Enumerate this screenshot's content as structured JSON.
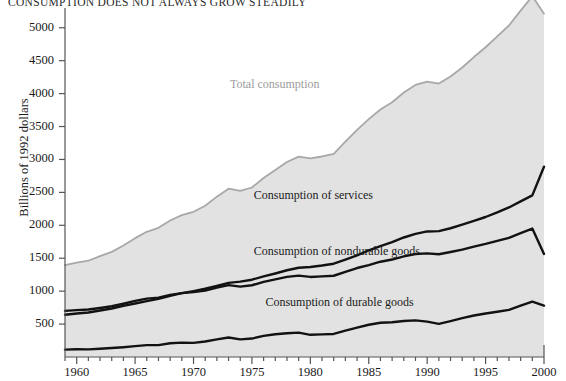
{
  "title": "CONSUMPTION DOES NOT ALWAYS GROW STEADILY",
  "axes": {
    "ylabel": "Billions of 1992 dollars",
    "yticks": [
      "500",
      "1000",
      "1500",
      "2000",
      "2500",
      "3000",
      "3500",
      "4000",
      "4500",
      "5000"
    ],
    "xticks": [
      "1960",
      "1965",
      "1970",
      "1975",
      "1980",
      "1985",
      "1990",
      "1995",
      "2000"
    ]
  },
  "colors": {
    "area_fill": "#e2e2e2",
    "total_line": "#a8a8a8",
    "component_line": "#121212",
    "axis": "#555555",
    "text": "#1a1a1a",
    "total_label": "#9b9b9b"
  },
  "chart_data": {
    "type": "line",
    "title": "CONSUMPTION DOES NOT ALWAYS GROW STEADILY",
    "xlabel": "",
    "ylabel": "Billions of 1992 dollars",
    "xlim": [
      1959,
      2000
    ],
    "ylim": [
      0,
      5300
    ],
    "yticks": [
      500,
      1000,
      1500,
      2000,
      2500,
      3000,
      3500,
      4000,
      4500,
      5000
    ],
    "xticks": [
      1960,
      1965,
      1970,
      1975,
      1980,
      1985,
      1990,
      1995,
      2000
    ],
    "xminor_step": 1,
    "grid": false,
    "legend": "inline-annotations",
    "x": [
      1959,
      1960,
      1961,
      1962,
      1963,
      1964,
      1965,
      1966,
      1967,
      1968,
      1969,
      1970,
      1971,
      1972,
      1973,
      1974,
      1975,
      1976,
      1977,
      1978,
      1979,
      1980,
      1981,
      1982,
      1983,
      1984,
      1985,
      1986,
      1987,
      1988,
      1989,
      1990,
      1991,
      1992,
      1993,
      1994,
      1995,
      1996,
      1997,
      1998,
      1999,
      2000
    ],
    "series": [
      {
        "name": "Total consumption",
        "color": "#a8a8a8",
        "filled": true,
        "values": [
          1394,
          1432,
          1462,
          1532,
          1597,
          1693,
          1805,
          1901,
          1962,
          2073,
          2154,
          2205,
          2298,
          2435,
          2556,
          2523,
          2574,
          2719,
          2840,
          2962,
          3042,
          3018,
          3045,
          3085,
          3271,
          3449,
          3613,
          3759,
          3869,
          4017,
          4131,
          4183,
          4152,
          4259,
          4396,
          4555,
          4704,
          4870,
          5034,
          5260,
          5480,
          5214
        ]
      },
      {
        "name": "Consumption of services",
        "color": "#121212",
        "filled": false,
        "values": [
          642,
          660,
          676,
          706,
          736,
          776,
          812,
          849,
          883,
          928,
          969,
          1001,
          1036,
          1080,
          1126,
          1144,
          1174,
          1223,
          1268,
          1317,
          1356,
          1367,
          1389,
          1417,
          1480,
          1543,
          1619,
          1684,
          1744,
          1815,
          1870,
          1907,
          1911,
          1955,
          2009,
          2066,
          2126,
          2196,
          2271,
          2363,
          2454,
          2890
        ]
      },
      {
        "name": "Consumption of nondurable goods",
        "color": "#121212",
        "filled": false,
        "values": [
          700,
          712,
          722,
          745,
          770,
          809,
          852,
          887,
          902,
          944,
          970,
          985,
          1010,
          1056,
          1092,
          1068,
          1090,
          1140,
          1180,
          1217,
          1236,
          1216,
          1224,
          1234,
          1294,
          1351,
          1395,
          1447,
          1480,
          1527,
          1564,
          1573,
          1560,
          1594,
          1630,
          1677,
          1717,
          1764,
          1810,
          1882,
          1951,
          1566
        ]
      },
      {
        "name": "Consumption of durable goods",
        "color": "#121212",
        "filled": false,
        "values": [
          112,
          118,
          116,
          126,
          136,
          149,
          165,
          180,
          180,
          208,
          219,
          214,
          235,
          268,
          296,
          268,
          280,
          320,
          345,
          360,
          370,
          337,
          344,
          350,
          400,
          447,
          490,
          520,
          527,
          546,
          556,
          537,
          503,
          545,
          590,
          630,
          661,
          688,
          716,
          780,
          840,
          780
        ]
      }
    ],
    "annotations": [
      {
        "text": "Total consumption",
        "x": 1981,
        "y": 4130
      },
      {
        "text": "Consumption of services",
        "x": 1982,
        "y": 2450
      },
      {
        "text": "Consumption of nondurable goods",
        "x": 1982,
        "y": 1600
      },
      {
        "text": "Consumption of durable goods",
        "x": 1983,
        "y": 820
      }
    ]
  }
}
